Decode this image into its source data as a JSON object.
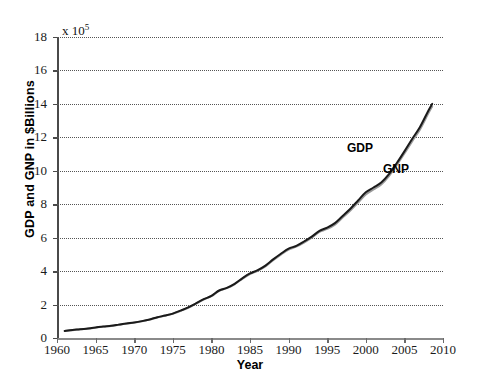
{
  "chart_data": {
    "type": "line",
    "title": "",
    "xlabel": "Year",
    "ylabel": "GDP and GNP in $Billions",
    "y_multiplier": "x 10",
    "y_multiplier_exponent": "5",
    "xlim": [
      1960,
      2010
    ],
    "ylim": [
      0,
      18
    ],
    "xticks": [
      1960,
      1965,
      1970,
      1975,
      1980,
      1985,
      1990,
      1995,
      2000,
      2005,
      2010
    ],
    "yticks": [
      0,
      2,
      4,
      6,
      8,
      10,
      12,
      14,
      16,
      18
    ],
    "grid": "horizontal-dotted",
    "legend_position": "inline-annotation",
    "colors": {
      "gdp": "#1a1a1a",
      "gnp": "#9a9a9a",
      "grid": "#555555",
      "axis": "#4a4a4a"
    },
    "x": [
      1961,
      1962,
      1963,
      1964,
      1965,
      1966,
      1967,
      1968,
      1969,
      1970,
      1971,
      1972,
      1973,
      1974,
      1975,
      1976,
      1977,
      1978,
      1979,
      1980,
      1981,
      1982,
      1983,
      1984,
      1985,
      1986,
      1987,
      1988,
      1989,
      1990,
      1991,
      1992,
      1993,
      1994,
      1995,
      1996,
      1997,
      1998,
      1999,
      2000,
      2001,
      2002,
      2003,
      2004,
      2005,
      2006,
      2007,
      2008,
      2008.6
    ],
    "series": [
      {
        "name": "GDP",
        "label": "GDP",
        "color": "#1a1a1a",
        "values": [
          0.42,
          0.48,
          0.52,
          0.57,
          0.63,
          0.69,
          0.73,
          0.8,
          0.87,
          0.93,
          1.01,
          1.11,
          1.24,
          1.34,
          1.46,
          1.64,
          1.83,
          2.07,
          2.32,
          2.52,
          2.84,
          3.0,
          3.24,
          3.57,
          3.86,
          4.06,
          4.33,
          4.7,
          5.04,
          5.34,
          5.51,
          5.77,
          6.06,
          6.41,
          6.6,
          6.87,
          7.3,
          7.73,
          8.22,
          8.71,
          9.0,
          9.3,
          9.8,
          10.45,
          11.16,
          11.9,
          12.6,
          13.5,
          14.0
        ],
        "approx_note": "values in units of 10^5 $Billions as plotted"
      },
      {
        "name": "GNP",
        "label": "GNP",
        "color": "#9a9a9a",
        "values": [
          0.42,
          0.47,
          0.52,
          0.56,
          0.62,
          0.68,
          0.72,
          0.79,
          0.86,
          0.92,
          1.0,
          1.1,
          1.23,
          1.33,
          1.45,
          1.62,
          1.81,
          2.05,
          2.3,
          2.5,
          2.82,
          2.98,
          3.21,
          3.54,
          3.82,
          4.02,
          4.28,
          4.65,
          4.99,
          5.29,
          5.46,
          5.71,
          6.0,
          6.34,
          6.52,
          6.78,
          7.2,
          7.62,
          8.1,
          8.58,
          8.88,
          9.18,
          9.68,
          10.33,
          11.03,
          11.76,
          12.46,
          13.35,
          13.85
        ],
        "approx_note": "values in units of 10^5 $Billions as plotted"
      }
    ],
    "annotations": [
      {
        "text": "GDP",
        "series": "GDP"
      },
      {
        "text": "GNP",
        "series": "GNP"
      }
    ]
  }
}
